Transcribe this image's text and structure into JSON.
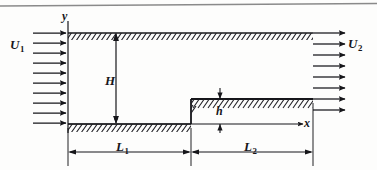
{
  "figure": {
    "type": "flow-geometry-diagram",
    "labels": {
      "inlet_velocity": "U",
      "inlet_velocity_sub": "1",
      "outlet_velocity": "U",
      "outlet_velocity_sub": "2",
      "y_axis": "y",
      "x_axis": "x",
      "channel_height": "H",
      "step_height": "h",
      "length_upstream": "L",
      "length_upstream_sub": "1",
      "length_downstream": "L",
      "length_downstream_sub": "2"
    },
    "colors": {
      "line": "#16161a",
      "hatch": "#1f1f24",
      "background": "#fdfdfc",
      "scan_rule": "#8a8a8a"
    },
    "geometry": {
      "top_wall_y": 33,
      "bottom_wall_y": 124,
      "inlet_x": 68,
      "step_x": 191,
      "outlet_x": 313,
      "step_top_y": 99,
      "dimension_line_y": 152,
      "inlet_arrow_count": 10,
      "outlet_arrow_count": 8
    }
  }
}
